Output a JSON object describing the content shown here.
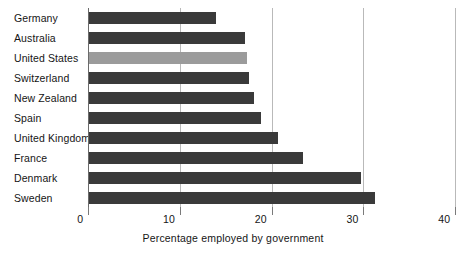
{
  "chart_data": {
    "type": "bar",
    "orientation": "horizontal",
    "title": "",
    "xlabel": "Percentage employed by government",
    "ylabel": "",
    "xlim": [
      0,
      40
    ],
    "xticks": [
      0,
      10,
      20,
      30,
      40
    ],
    "xticklabels": [
      "0",
      "10",
      "20",
      "30",
      "40"
    ],
    "grid": "vertical",
    "legend": "none",
    "categories": [
      "Germany",
      "Australia",
      "United States",
      "Switzerland",
      "New Zealand",
      "Spain",
      "United Kingdom",
      "France",
      "Denmark",
      "Sweden"
    ],
    "values": [
      13.8,
      17.0,
      17.2,
      17.4,
      18.0,
      18.8,
      20.6,
      23.3,
      29.7,
      31.2
    ],
    "bar_colors": [
      "#3a3a3a",
      "#3a3a3a",
      "#9b9b9b",
      "#3a3a3a",
      "#3a3a3a",
      "#3a3a3a",
      "#3a3a3a",
      "#3a3a3a",
      "#3a3a3a",
      "#3a3a3a"
    ],
    "highlighted_category": "United States",
    "colors": {
      "bar_default": "#3a3a3a",
      "bar_highlight": "#9b9b9b",
      "gridline": "#b9b9b9",
      "axis": "#6b6b6b",
      "text": "#151515",
      "background": "#ffffff"
    }
  }
}
